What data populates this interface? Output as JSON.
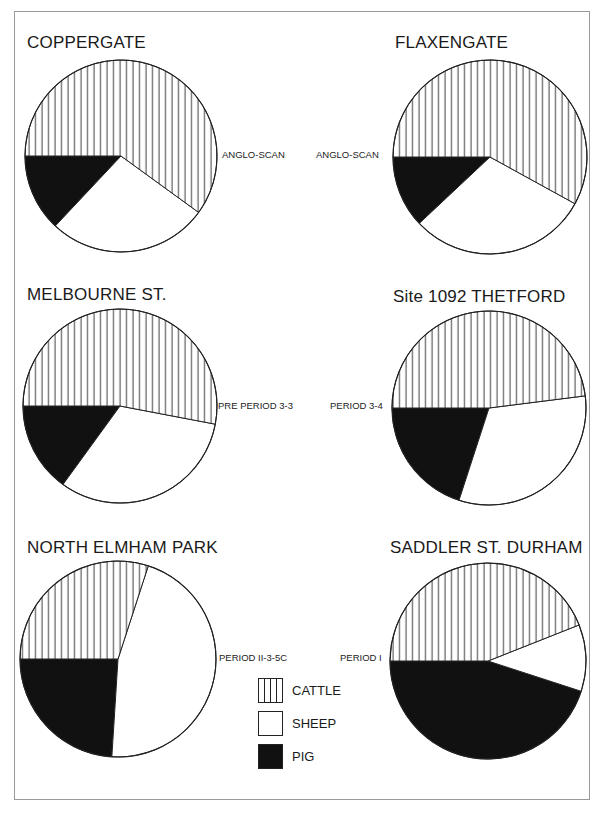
{
  "chart_data": [
    {
      "type": "pie",
      "title": "COPPERGATE",
      "subtitle": "ANGLO-SCAN",
      "categories": [
        "CATTLE",
        "SHEEP",
        "PIG"
      ],
      "values": [
        60,
        27,
        13
      ],
      "units": "% (estimated from slice angles)"
    },
    {
      "type": "pie",
      "title": "FLAXENGATE",
      "subtitle": "ANGLO-SCAN",
      "categories": [
        "CATTLE",
        "SHEEP",
        "PIG"
      ],
      "values": [
        58,
        30,
        12
      ],
      "units": "% (estimated from slice angles)"
    },
    {
      "type": "pie",
      "title": "MELBOURNE ST.",
      "subtitle": "PRE PERIOD 3-3",
      "categories": [
        "CATTLE",
        "SHEEP",
        "PIG"
      ],
      "values": [
        53,
        32,
        15
      ],
      "units": "% (estimated from slice angles)"
    },
    {
      "type": "pie",
      "title": "Site 1092 THETFORD",
      "subtitle": "PERIOD 3-4",
      "categories": [
        "CATTLE",
        "SHEEP",
        "PIG"
      ],
      "values": [
        48,
        32,
        20
      ],
      "units": "% (estimated from slice angles)"
    },
    {
      "type": "pie",
      "title": "NORTH ELMHAM PARK",
      "subtitle": "PERIOD II-3-5C",
      "categories": [
        "CATTLE",
        "SHEEP",
        "PIG"
      ],
      "values": [
        30,
        46,
        24
      ],
      "units": "% (estimated from slice angles)"
    },
    {
      "type": "pie",
      "title": "SADDLER ST. DURHAM",
      "subtitle": "PERIOD I",
      "categories": [
        "CATTLE",
        "SHEEP",
        "PIG"
      ],
      "values": [
        44,
        11,
        45
      ],
      "units": "% (estimated from slice angles)"
    }
  ],
  "legend": {
    "position": "bottom-center",
    "items": [
      {
        "label": "CATTLE",
        "pattern": "vertical-hatch"
      },
      {
        "label": "SHEEP",
        "pattern": "white"
      },
      {
        "label": "PIG",
        "pattern": "solid-black"
      }
    ]
  },
  "colors": {
    "cattle": "#ffffff",
    "cattle_hatch": "#222222",
    "sheep": "#ffffff",
    "pig": "#111111",
    "outline": "#222222",
    "frame": "#9a9a9a"
  }
}
